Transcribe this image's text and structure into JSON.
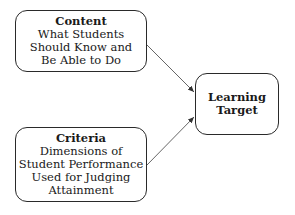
{
  "diagram": {
    "content": {
      "title": "Content",
      "lines": [
        "What Students",
        "Should Know and",
        "Be Able to Do"
      ]
    },
    "criteria": {
      "title": "Criteria",
      "lines": [
        "Dimensions of",
        "Student Performance",
        "Used for Judging",
        "Attainment"
      ]
    },
    "target": {
      "lines": [
        "Learning",
        "Target"
      ]
    },
    "edges": [
      {
        "from": "Content",
        "to": "Learning Target"
      },
      {
        "from": "Criteria",
        "to": "Learning Target"
      }
    ]
  }
}
